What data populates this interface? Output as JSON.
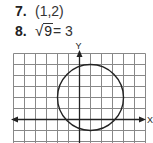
{
  "answers": [
    {
      "number": "7.",
      "value": "(1,2)"
    },
    {
      "number": "8.",
      "radical": "√",
      "radicand": "9",
      "rest": " = 3"
    }
  ],
  "graph": {
    "y_label": "Y",
    "x_label": "X",
    "grid_columns": 12,
    "grid_rows": 8,
    "cell_px": 11,
    "origin_cell": {
      "col": 6,
      "row": 6
    },
    "circle": {
      "center": [
        1,
        2
      ],
      "radius": 3
    },
    "colors": {
      "grid": "#777777",
      "axis": "#222222",
      "circle": "#222222"
    }
  }
}
